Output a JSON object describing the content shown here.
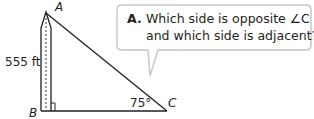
{
  "diagram": {
    "vertices": {
      "A": "A",
      "B": "B",
      "C": "C"
    },
    "side_label": "555 ft",
    "angle_label": "75°",
    "right_angle_at": "B",
    "object": "monument"
  },
  "callout": {
    "prefix": "A.",
    "line1": "Which side is opposite ∠C",
    "line2": "and which side is adjacent?"
  },
  "colors": {
    "line": "#231f20",
    "bubble_border": "#c8c8c8",
    "text": "#231f20"
  }
}
